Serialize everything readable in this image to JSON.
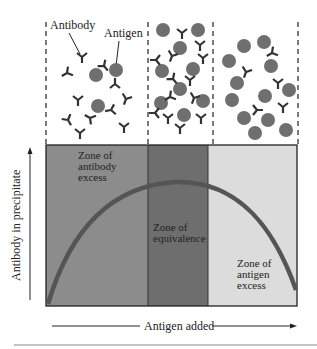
{
  "top_labels": {
    "antibody": "Antibody",
    "antigen": "Antigen"
  },
  "zones": [
    {
      "key": "antibody_excess",
      "lines": [
        "Zone of",
        "antibody",
        "excess"
      ],
      "color": "#8c8c8c"
    },
    {
      "key": "equivalence",
      "lines": [
        "Zone of",
        "equivalence"
      ],
      "color": "#6e6e6e"
    },
    {
      "key": "antigen_excess",
      "lines": [
        "Zone of",
        "antigen",
        "excess"
      ],
      "color": "#dcdcdc"
    }
  ],
  "axes": {
    "y_label": "Antibody in precipitate",
    "x_label": "Antigen added"
  },
  "colors": {
    "antigen": "#6f6f6f",
    "antibody": "#333333",
    "curve": "#555555"
  }
}
